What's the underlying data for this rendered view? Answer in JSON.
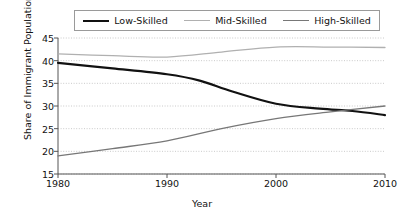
{
  "chart_data": {
    "type": "line",
    "title": "",
    "xlabel": "Year",
    "ylabel": "Share of Immigrant Population",
    "x": [
      1980,
      1990,
      2000,
      2010
    ],
    "xlim": [
      1980,
      2010
    ],
    "ylim": [
      15,
      45
    ],
    "xticks": [
      1980,
      1990,
      2000,
      2010
    ],
    "yticks": [
      15,
      20,
      25,
      30,
      35,
      40,
      45
    ],
    "grid": true,
    "legend_position": "top",
    "series": [
      {
        "name": "Low-Skilled",
        "color": "#111111",
        "width": 2.2,
        "values": [
          39.5,
          37.0,
          30.5,
          28.0
        ],
        "points": [
          [
            1980,
            39.5
          ],
          [
            1985,
            38.3
          ],
          [
            1990,
            37.0
          ],
          [
            1993,
            35.6
          ],
          [
            1996,
            33.2
          ],
          [
            2000,
            30.5
          ],
          [
            2004,
            29.4
          ],
          [
            2007,
            28.9
          ],
          [
            2010,
            28.0
          ]
        ]
      },
      {
        "name": "Mid-Skilled",
        "color": "#b0b0b0",
        "width": 1.3,
        "values": [
          41.5,
          40.8,
          43.0,
          43.0
        ],
        "points": [
          [
            1980,
            41.5
          ],
          [
            1985,
            41.1
          ],
          [
            1990,
            40.8
          ],
          [
            1995,
            41.9
          ],
          [
            2000,
            43.0
          ],
          [
            2005,
            43.0
          ],
          [
            2010,
            42.9
          ]
        ]
      },
      {
        "name": "High-Skilled",
        "color": "#777777",
        "width": 1.3,
        "values": [
          19.0,
          22.3,
          27.2,
          30.0
        ],
        "points": [
          [
            1980,
            19.0
          ],
          [
            1985,
            20.6
          ],
          [
            1990,
            22.3
          ],
          [
            1995,
            25.0
          ],
          [
            2000,
            27.2
          ],
          [
            2005,
            28.7
          ],
          [
            2010,
            30.0
          ]
        ]
      }
    ],
    "annotations": []
  },
  "legend": {
    "entries": [
      {
        "label": "Low-Skilled"
      },
      {
        "label": "Mid-Skilled"
      },
      {
        "label": "High-Skilled"
      }
    ]
  },
  "axes": {
    "x_title": "Year",
    "y_title": "Share of Immigrant Population",
    "x_tick_labels": [
      "1980",
      "1990",
      "2000",
      "2010"
    ],
    "y_tick_labels": [
      "15",
      "20",
      "25",
      "30",
      "35",
      "40",
      "45"
    ]
  },
  "colors": {
    "low_skilled": "#111111",
    "mid_skilled": "#b0b0b0",
    "high_skilled": "#777777",
    "axis": "#555555",
    "grid": "#bdbdbd",
    "legend_border": "#9a9a9a",
    "background": "#ffffff"
  }
}
